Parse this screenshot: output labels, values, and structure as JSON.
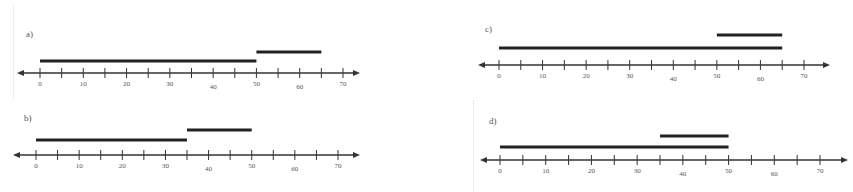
{
  "panels": [
    {
      "label": "a)",
      "label_pos": [
        26,
        37
      ],
      "axis_y": 73,
      "x0": 40,
      "x70": 343,
      "axis_start": 17,
      "axis_end": 360,
      "segments": [
        {
          "from": 0,
          "to": 50,
          "y": 61
        },
        {
          "from": 50,
          "to": 65,
          "y": 52
        }
      ]
    },
    {
      "label": "b)",
      "label_pos": [
        24,
        121
      ],
      "axis_y": 155,
      "x0": 36,
      "x70": 338,
      "axis_start": 13,
      "axis_end": 360,
      "segments": [
        {
          "from": 0,
          "to": 35,
          "y": 140
        },
        {
          "from": 35,
          "to": 50,
          "y": 130
        }
      ]
    },
    {
      "label": "c)",
      "label_pos": [
        485,
        32
      ],
      "axis_y": 65,
      "x0": 499,
      "x70": 804,
      "axis_start": 478,
      "axis_end": 830,
      "segments": [
        {
          "from": 0,
          "to": 65,
          "y": 48
        },
        {
          "from": 50,
          "to": 65,
          "y": 35
        }
      ]
    },
    {
      "label": "d)",
      "label_pos": [
        489,
        124
      ],
      "axis_y": 160,
      "x0": 500,
      "x70": 820,
      "axis_start": 480,
      "axis_end": 848,
      "segments": [
        {
          "from": 0,
          "to": 50,
          "y": 147
        },
        {
          "from": 35,
          "to": 50,
          "y": 136
        }
      ]
    }
  ],
  "tick_labels": [
    "0",
    "10",
    "20",
    "30",
    "40",
    "50",
    "60",
    "70"
  ],
  "colors": {
    "line": "#333333",
    "segment": "#222222",
    "text": "#555555"
  }
}
